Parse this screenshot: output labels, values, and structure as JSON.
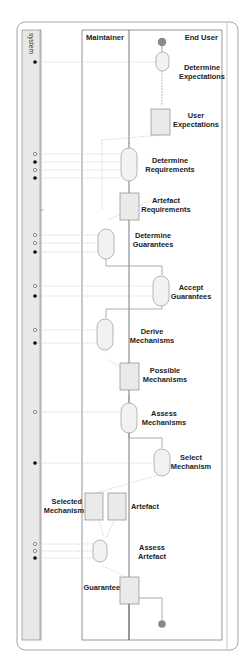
{
  "diagram": {
    "type": "activity-diagram",
    "colors": {
      "frame": "#9a9a9a",
      "lane_line": "#555555",
      "system_fill": "#e6e6e6",
      "node_fill": "#eeeeee",
      "node_stroke": "#9a9a9a",
      "initial_fill": "#8a8a8a",
      "flow": "#8a8a8a",
      "data_flow": "#b0b0b0",
      "pin_filled": "#111111",
      "pin_open": "#ffffff"
    },
    "lanes": {
      "system": "system",
      "maintainer": "Maintainer",
      "end_user": "End User"
    },
    "actions": [
      {
        "id": "a1",
        "label_lines": [
          "Determine",
          "Expectations"
        ],
        "lane": "End User"
      },
      {
        "id": "a2",
        "label_lines": [
          "Determine",
          "Requirements"
        ],
        "lane": "End User"
      },
      {
        "id": "a3",
        "label_lines": [
          "Determine",
          "Guarantees"
        ],
        "lane": "Maintainer"
      },
      {
        "id": "a4",
        "label_lines": [
          "Accept",
          "Guarantees"
        ],
        "lane": "End User"
      },
      {
        "id": "a5",
        "label_lines": [
          "Derive",
          "Mechanisms"
        ],
        "lane": "Maintainer"
      },
      {
        "id": "a6",
        "label_lines": [
          "Assess",
          "Mechanisms"
        ],
        "lane": "End User"
      },
      {
        "id": "a7",
        "label_lines": [
          "Select",
          "Mechanism"
        ],
        "lane": "End User"
      },
      {
        "id": "a8",
        "label_lines": [
          "Assess",
          "Artefact"
        ],
        "lane": "Maintainer"
      }
    ],
    "objects": [
      {
        "id": "o1",
        "label_lines": [
          "User",
          "Expectations"
        ]
      },
      {
        "id": "o2",
        "label_lines": [
          "Artefact",
          "Requirements"
        ]
      },
      {
        "id": "o3",
        "label_lines": [
          "Possible",
          "Mechanisms"
        ]
      },
      {
        "id": "o4",
        "label_lines": [
          "Selected",
          "Mechanism"
        ]
      },
      {
        "id": "o5",
        "label_lines": [
          "Artefact"
        ]
      },
      {
        "id": "o6",
        "label_lines": [
          "Guarantee"
        ]
      }
    ],
    "system_pins": [
      {
        "y": 62,
        "kind": "filled"
      },
      {
        "y": 154,
        "kind": "open"
      },
      {
        "y": 162,
        "kind": "filled"
      },
      {
        "y": 170,
        "kind": "open"
      },
      {
        "y": 178,
        "kind": "filled"
      },
      {
        "y": 235,
        "kind": "open"
      },
      {
        "y": 243,
        "kind": "open"
      },
      {
        "y": 252,
        "kind": "filled"
      },
      {
        "y": 286,
        "kind": "open"
      },
      {
        "y": 296,
        "kind": "filled"
      },
      {
        "y": 330,
        "kind": "open"
      },
      {
        "y": 343,
        "kind": "filled"
      },
      {
        "y": 412,
        "kind": "open"
      },
      {
        "y": 463,
        "kind": "filled"
      },
      {
        "y": 544,
        "kind": "open"
      },
      {
        "y": 551,
        "kind": "open"
      },
      {
        "y": 558,
        "kind": "filled"
      }
    ]
  }
}
